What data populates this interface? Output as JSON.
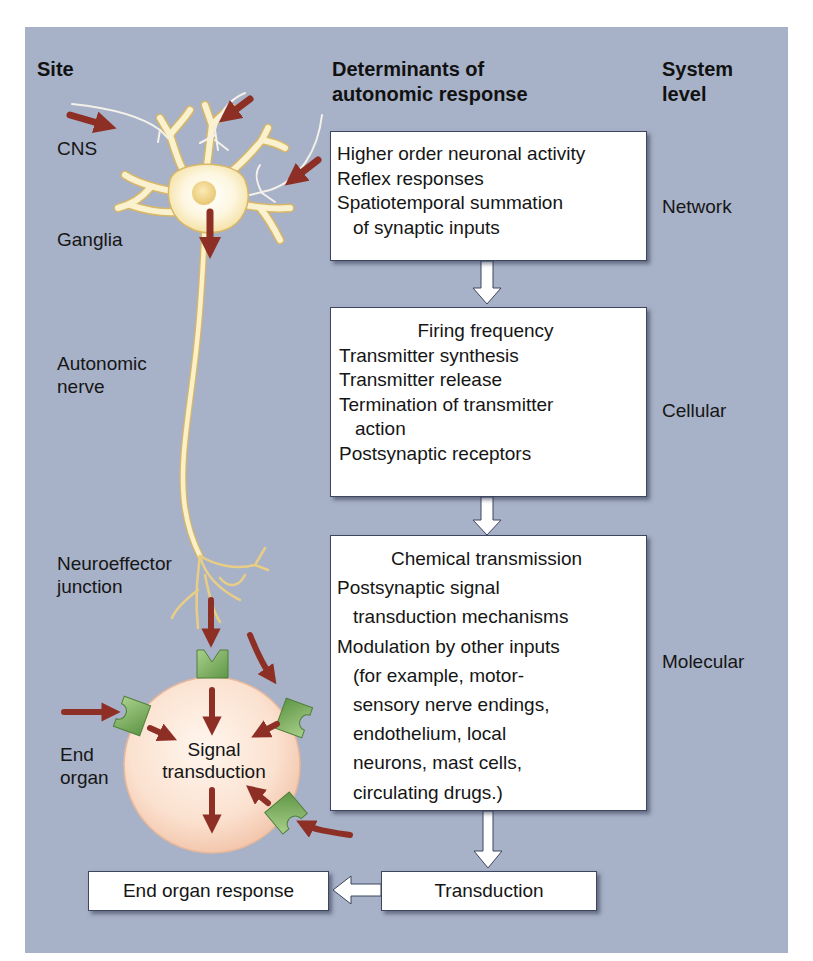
{
  "headers": {
    "site": "Site",
    "determinants_line1": "Determinants of",
    "determinants_line2": "autonomic response",
    "system_line1": "System",
    "system_line2": "level"
  },
  "sites": {
    "cns": "CNS",
    "ganglia": "Ganglia",
    "autonomic_nerve_line1": "Autonomic",
    "autonomic_nerve_line2": "nerve",
    "neuroeffector_line1": "Neuroeffector",
    "neuroeffector_line2": "junction",
    "end_organ_line1": "End",
    "end_organ_line2": "organ"
  },
  "signal_transduction": {
    "line1": "Signal",
    "line2": "transduction"
  },
  "boxes": {
    "network": {
      "lines": [
        "Higher order neuronal activity",
        "Reflex responses",
        "Spatiotemporal summation",
        "of synaptic inputs"
      ]
    },
    "cellular": {
      "lines": [
        "Firing frequency",
        "Transmitter synthesis",
        "Transmitter release",
        "Termination of transmitter",
        "action",
        "Postsynaptic receptors"
      ]
    },
    "molecular": {
      "lines": [
        "Chemical transmission",
        "Postsynaptic signal",
        "transduction mechanisms",
        "Modulation by other inputs",
        "(for example, motor-",
        "sensory nerve endings,",
        "endothelium, local",
        "neurons, mast cells,",
        "circulating drugs.)"
      ]
    },
    "transduction": "Transduction",
    "end_organ_response": "End organ response"
  },
  "levels": {
    "network": "Network",
    "cellular": "Cellular",
    "molecular": "Molecular"
  },
  "colors": {
    "panel_background": "#a7b1c7",
    "neuron_fill": "#f9efc8",
    "neuron_outline": "#d8b766",
    "arrow_red": "#8e2f26",
    "receptor_green": "#7fb35f",
    "cell_fill": "#fbe3d2",
    "box_border": "#3d4660"
  }
}
